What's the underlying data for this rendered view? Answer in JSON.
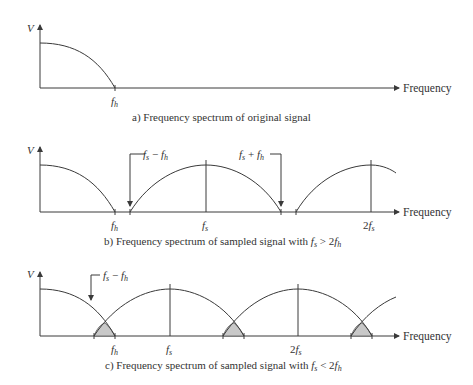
{
  "axis": {
    "y_label": "V",
    "x_label": "Frequency"
  },
  "colors": {
    "line": "#3a3a3a",
    "shade": "#c8c8c8",
    "background": "#ffffff"
  },
  "panels": [
    {
      "id": "a",
      "caption": "a) Frequency spectrum of original signal",
      "ticks": [
        "f_h"
      ],
      "tick_display": [
        "fh"
      ]
    },
    {
      "id": "b",
      "caption_prefix": "b) Frequency spectrum of sampled signal with ",
      "caption_condition": "fs > 2fh",
      "ticks": [
        "f_h",
        "f_s",
        "2f_s"
      ],
      "annotations": [
        "fs − fh",
        "fs + fh"
      ]
    },
    {
      "id": "c",
      "caption_prefix": "c) Frequency spectrum of sampled signal with ",
      "caption_condition": "fs < 2fh",
      "ticks": [
        "f_h",
        "f_s",
        "2f_s"
      ],
      "annotations": [
        "fs − fh"
      ],
      "shaded_regions": "aliasing overlap regions (3)"
    }
  ],
  "labels": {
    "fh_f": "f",
    "fh_sub": "h",
    "fs_f": "f",
    "fs_sub": "s",
    "two": "2",
    "minus": " − ",
    "plus": " + ",
    "gt": " > ",
    "lt": " < "
  }
}
